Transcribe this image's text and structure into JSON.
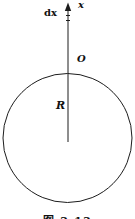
{
  "figure": {
    "labels": {
      "axis": "x",
      "element": "dx",
      "top_point": "O",
      "radius": "R"
    },
    "caption": "图 2-13"
  },
  "colors": {
    "background": "#ffffff",
    "stroke": "#1c1c1c",
    "text": "#111111"
  }
}
